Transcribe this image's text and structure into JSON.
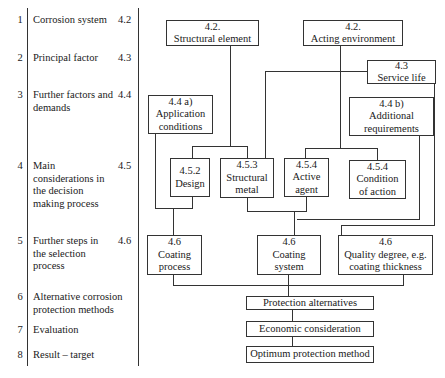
{
  "steps": [
    {
      "num": "1",
      "label": "Corrosion system",
      "ref": "4.2"
    },
    {
      "num": "2",
      "label": "Principal factor",
      "ref": "4.3"
    },
    {
      "num": "3",
      "label": "Further factors and demands",
      "ref": "4.4"
    },
    {
      "num": "4",
      "label": "Main considerations in the decision making process",
      "ref": "4.5"
    },
    {
      "num": "5",
      "label": "Further steps in the selection process",
      "ref": "4.6"
    },
    {
      "num": "6",
      "label": "Alternative corrosion protection methods",
      "ref": ""
    },
    {
      "num": "7",
      "label": "Evaluation",
      "ref": ""
    },
    {
      "num": "8",
      "label": "Result – target",
      "ref": ""
    }
  ],
  "boxes": {
    "structural_element": {
      "ref": "4.2.",
      "label": "Structural element"
    },
    "acting_environment": {
      "ref": "4.2.",
      "label": "Acting environment"
    },
    "service_life": {
      "ref": "4.3",
      "label": "Service life"
    },
    "application_conditions": {
      "ref": "4.4 a)",
      "label1": "Application",
      "label2": "conditions"
    },
    "additional_requirements": {
      "ref": "4.4 b)",
      "label1": "Additional",
      "label2": "requirements"
    },
    "design": {
      "ref": "4.5.2",
      "label": "Design"
    },
    "structural_metal": {
      "ref": "4.5.3",
      "label1": "Structural",
      "label2": "metal"
    },
    "active_agent": {
      "ref": "4.5.4",
      "label1": "Active",
      "label2": "agent"
    },
    "condition_of_action": {
      "ref": "4.5.4",
      "label1": "Condition",
      "label2": "of action"
    },
    "coating_process": {
      "ref": "4.6",
      "label1": "Coating",
      "label2": "process"
    },
    "coating_system": {
      "ref": "4.6",
      "label1": "Coating",
      "label2": "system"
    },
    "quality_degree": {
      "ref": "4.6",
      "label1": "Quality degree, e.g.",
      "label2": "coating thickness"
    },
    "protection_alternatives": {
      "label": "Protection alternatives"
    },
    "economic_consideration": {
      "label": "Economic consideration"
    },
    "optimum_protection_method": {
      "label": "Optimum protection method"
    }
  }
}
